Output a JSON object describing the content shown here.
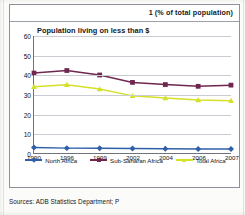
{
  "page": {
    "header_note": "1 (% of total population)",
    "source_text": "Sources: ADB Statistics Department; P"
  },
  "chart_data": {
    "type": "line",
    "title": "Population living on less than $",
    "subtitle": "",
    "xlabel": "",
    "ylabel": "",
    "ylim": [
      0,
      60
    ],
    "yticks": [
      60,
      50,
      40,
      30,
      20,
      10,
      0
    ],
    "grid": true,
    "legend_position": "bottom",
    "categories": [
      "1990",
      "1996",
      "1999",
      "2002",
      "2004",
      "2006",
      "2007"
    ],
    "series": [
      {
        "name": "North Africa",
        "color": "#2f5fa8",
        "marker": "diamond",
        "values": [
          2.8,
          2.5,
          2.4,
          2.3,
          2.2,
          2.1,
          2.1
        ]
      },
      {
        "name": "Sub-Saharan Africa",
        "color": "#70274f",
        "marker": "square",
        "values": [
          41.0,
          42.3,
          40.0,
          36.2,
          35.1,
          34.2,
          34.8
        ]
      },
      {
        "name": "Total Africa",
        "color": "#d4e02a",
        "marker": "triangle",
        "values": [
          34.0,
          35.0,
          32.8,
          29.3,
          28.2,
          27.2,
          26.8
        ]
      }
    ]
  }
}
